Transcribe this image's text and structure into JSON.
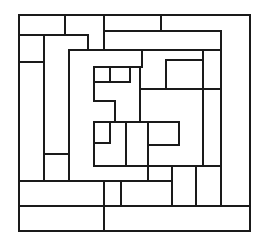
{
  "diagram": {
    "type": "rectangular-maze",
    "stroke_color": "#1a1a1a",
    "background": "#ffffff",
    "frame": {
      "x1": 19,
      "y1": 15,
      "x2": 250,
      "y2": 231
    },
    "segments": [
      [
        19,
        15,
        250,
        15
      ],
      [
        19,
        15,
        19,
        231
      ],
      [
        250,
        15,
        250,
        231
      ],
      [
        19,
        231,
        250,
        231
      ],
      [
        65,
        15,
        65,
        35
      ],
      [
        104,
        15,
        104,
        50
      ],
      [
        161,
        15,
        161,
        31
      ],
      [
        104,
        31,
        221,
        31
      ],
      [
        221,
        31,
        221,
        206
      ],
      [
        19,
        35,
        88,
        35
      ],
      [
        88,
        35,
        88,
        50
      ],
      [
        69,
        50,
        221,
        50
      ],
      [
        44,
        35,
        44,
        181
      ],
      [
        19,
        62,
        44,
        62
      ],
      [
        69,
        50,
        69,
        181
      ],
      [
        44,
        154,
        69,
        154
      ],
      [
        142,
        50,
        142,
        67
      ],
      [
        94,
        67,
        142,
        67
      ],
      [
        110,
        67,
        110,
        82
      ],
      [
        130,
        67,
        130,
        82
      ],
      [
        94,
        82,
        130,
        82
      ],
      [
        94,
        67,
        94,
        101
      ],
      [
        94,
        101,
        115,
        101
      ],
      [
        115,
        101,
        115,
        122
      ],
      [
        140,
        67,
        140,
        122
      ],
      [
        140,
        89,
        221,
        89
      ],
      [
        166,
        60,
        203,
        60
      ],
      [
        166,
        60,
        166,
        89
      ],
      [
        203,
        50,
        203,
        166
      ],
      [
        94,
        122,
        179,
        122
      ],
      [
        94,
        122,
        94,
        166
      ],
      [
        110,
        122,
        110,
        143
      ],
      [
        94,
        143,
        110,
        143
      ],
      [
        126,
        122,
        126,
        166
      ],
      [
        148,
        122,
        148,
        181
      ],
      [
        148,
        145,
        179,
        145
      ],
      [
        179,
        122,
        179,
        145
      ],
      [
        94,
        166,
        221,
        166
      ],
      [
        19,
        181,
        172,
        181
      ],
      [
        172,
        166,
        172,
        206
      ],
      [
        196,
        166,
        196,
        206
      ],
      [
        104,
        181,
        104,
        231
      ],
      [
        121,
        181,
        121,
        206
      ],
      [
        19,
        206,
        250,
        206
      ]
    ]
  }
}
